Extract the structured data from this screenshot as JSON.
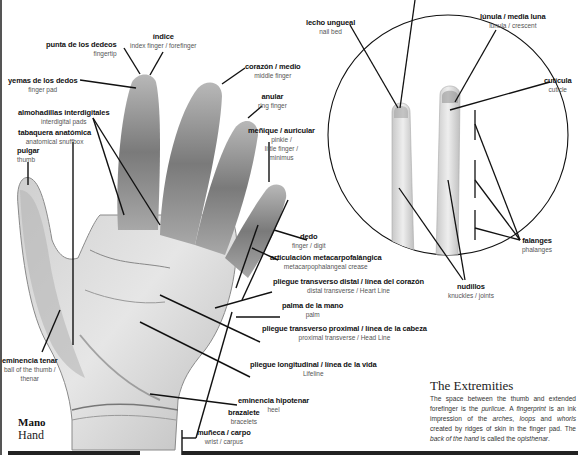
{
  "page": {
    "section_title_es": "Mano",
    "section_title_en": "Hand",
    "sidebar": {
      "heading": "The Extremities",
      "body_parts": [
        {
          "text": "The space between the thumb and extended forefinger is the ",
          "italic": false
        },
        {
          "text": "purlicue",
          "italic": true
        },
        {
          "text": ". A ",
          "italic": false
        },
        {
          "text": "fingerprint",
          "italic": true
        },
        {
          "text": " is an ink impression of the ",
          "italic": false
        },
        {
          "text": "arches",
          "italic": true
        },
        {
          "text": ", ",
          "italic": false
        },
        {
          "text": "loops",
          "italic": true
        },
        {
          "text": " and ",
          "italic": false
        },
        {
          "text": "whorls",
          "italic": true
        },
        {
          "text": " created by ridges of skin in the finger pad. The ",
          "italic": false
        },
        {
          "text": "back of the hand",
          "italic": true
        },
        {
          "text": " is called the ",
          "italic": false
        },
        {
          "text": "opisthenar",
          "italic": true
        },
        {
          "text": ".",
          "italic": false
        }
      ]
    }
  },
  "hand_labels": [
    {
      "id": "fingertip",
      "es": "punta de los dedeos",
      "en": "fingertip"
    },
    {
      "id": "index",
      "es": "índice",
      "en": "index finger / forefinger"
    },
    {
      "id": "finger-pad",
      "es": "yemas de los dedos",
      "en": "finger pad"
    },
    {
      "id": "middle",
      "es": "corazón / medio",
      "en": "middle finger"
    },
    {
      "id": "ring",
      "es": "anular",
      "en": "ring finger"
    },
    {
      "id": "interdigital",
      "es": "almohadillas interdigitales",
      "en": "interdigital pads"
    },
    {
      "id": "snuffbox",
      "es": "tabaquera anatómica",
      "en": "anatomical snuffbox"
    },
    {
      "id": "thumb",
      "es": "pulgar",
      "en": "thumb"
    },
    {
      "id": "pinkie",
      "es": "meñique / auricular",
      "en1": "pinkie /",
      "en2": "little finger /",
      "en3": "minimus"
    },
    {
      "id": "digit",
      "es": "dedo",
      "en": "finger / digit"
    },
    {
      "id": "mcp",
      "es": "articulación metacarpofalángica",
      "en": "metacarpophalangeal crease"
    },
    {
      "id": "heart",
      "es": "pliegue transverso distal / línea del corazón",
      "en": "distal transverse / Heart Line"
    },
    {
      "id": "palm",
      "es": "palma de la mano",
      "en": "palm"
    },
    {
      "id": "head",
      "es": "pliegue transverso proximal / línea de la cabeza",
      "en": "proximal transverse / Head Line"
    },
    {
      "id": "life",
      "es": "pliegue longitudinal / línea de la vida",
      "en": "Lifeline"
    },
    {
      "id": "thenar",
      "es": "eminencia tenar",
      "en1": "ball of the thumb /",
      "en2": "thenar"
    },
    {
      "id": "hypothenar",
      "es": "eminencia hipotenar",
      "en": "heel"
    },
    {
      "id": "bracelets",
      "es": "brazalete",
      "en": "bracelets"
    },
    {
      "id": "wrist",
      "es": "muñeca / carpo",
      "en": "wrist / carpus"
    }
  ],
  "detail_labels": [
    {
      "id": "nail-bed",
      "es": "lecho ungueal",
      "en": "nail bed"
    },
    {
      "id": "lunula",
      "es": "lúnula / media luna",
      "en": "lunula / crescent"
    },
    {
      "id": "cuticle",
      "es": "cutícula",
      "en": "cuticle"
    },
    {
      "id": "phalanges",
      "es": "falanges",
      "en": "phalanges"
    },
    {
      "id": "knuckles",
      "es": "nudillos",
      "en": "knuckles / joints"
    }
  ]
}
